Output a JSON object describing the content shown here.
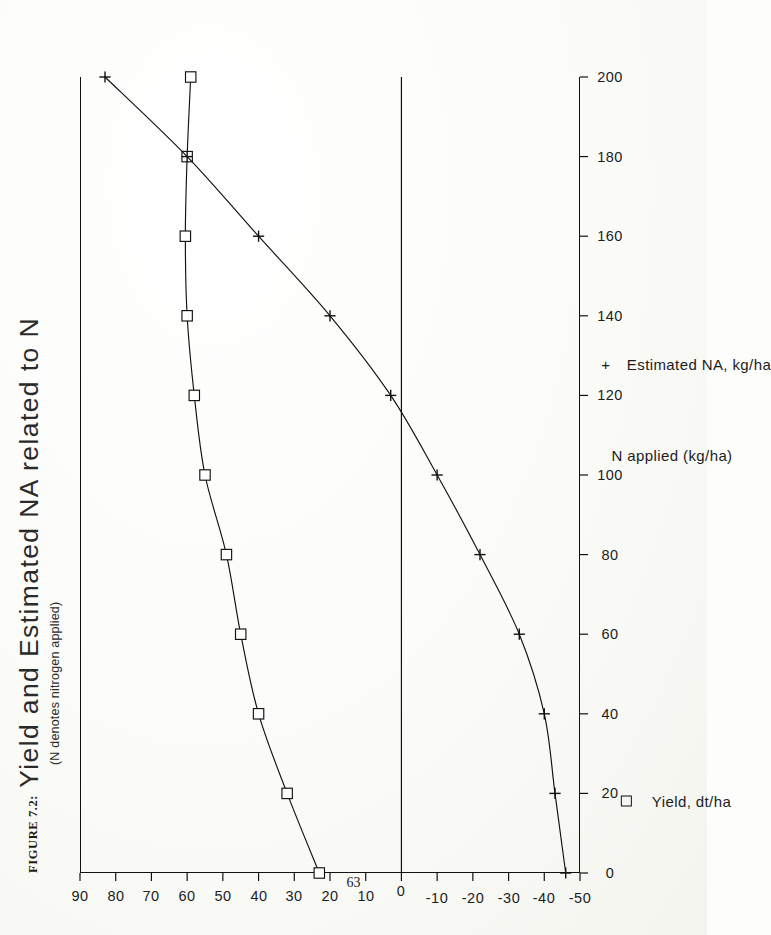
{
  "page": {
    "folio": "63"
  },
  "figure": {
    "label": "FIGURE 7.2:",
    "title": "Yield and Estimated NA related to N",
    "subtitle": "(N denotes nitrogen applied)"
  },
  "legend": [
    {
      "marker": "square",
      "marker_glyph": "□",
      "label": "Yield, dt/ha"
    },
    {
      "marker": "plus",
      "marker_glyph": "+",
      "label": "Estimated NA, kg/ha"
    }
  ],
  "chart_data": {
    "type": "line",
    "title": "Yield and Estimated NA related to N",
    "subtitle": "(N denotes nitrogen applied)",
    "xlabel": "N applied (kg/ha)",
    "ylabel": "",
    "xlim": [
      0,
      200
    ],
    "ylim": [
      -50,
      90
    ],
    "xticks": [
      0,
      20,
      40,
      60,
      80,
      100,
      120,
      140,
      160,
      180,
      200
    ],
    "yticks": [
      90,
      80,
      70,
      60,
      50,
      40,
      30,
      20,
      10,
      0,
      -10,
      -20,
      -30,
      -40,
      -50
    ],
    "xtick_labels": [
      "0",
      "20",
      "40",
      "60",
      "80",
      "100",
      "120",
      "140",
      "160",
      "180",
      "200"
    ],
    "ytick_labels": [
      "90",
      "80",
      "70",
      "60",
      "50",
      "40",
      "30",
      "20",
      "10",
      "0",
      "-10",
      "-20",
      "-30",
      "-40",
      "-50"
    ],
    "grid": false,
    "zero_reference_line": 0,
    "legend_position": "below-axis",
    "x": [
      0,
      20,
      40,
      60,
      80,
      100,
      120,
      140,
      160,
      180,
      200
    ],
    "series": [
      {
        "name": "Yield, dt/ha",
        "marker": "square",
        "values": [
          23,
          32,
          40,
          45,
          49,
          55,
          58,
          60,
          60.5,
          60,
          59
        ]
      },
      {
        "name": "Estimated NA, kg/ha",
        "marker": "plus",
        "values": [
          -46,
          -43,
          -40,
          -33,
          -22,
          -10,
          3,
          20,
          40,
          60,
          83
        ]
      }
    ],
    "annotations": [
      {
        "text": "NA crosses zero near N = 115 kg/ha",
        "x": 115,
        "y": 0
      }
    ]
  }
}
